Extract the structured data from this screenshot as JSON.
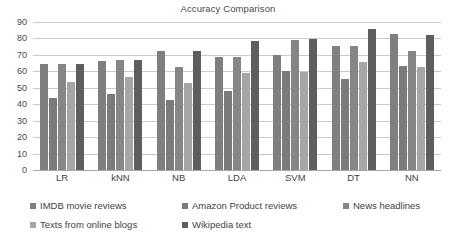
{
  "chart_data": {
    "type": "bar",
    "title": "Accuracy Comparison",
    "xlabel": "",
    "ylabel": "",
    "ylim": [
      0,
      90
    ],
    "yticks": [
      0,
      10,
      20,
      30,
      40,
      50,
      60,
      70,
      80,
      90
    ],
    "grid": true,
    "legend_position": "bottom",
    "categories": [
      "LR",
      "kNN",
      "NB",
      "LDA",
      "SVM",
      "DT",
      "NN"
    ],
    "series": [
      {
        "name": "IMDB movie reviews",
        "color": "#7f7f7f",
        "values": [
          64.5,
          66.3,
          72.5,
          68.5,
          70.0,
          75.2,
          83.0
        ]
      },
      {
        "name": "Amazon Product reviews",
        "color": "#7b7b7b",
        "values": [
          44.0,
          46.2,
          42.3,
          48.3,
          60.3,
          55.5,
          63.5
        ]
      },
      {
        "name": "News headlines",
        "color": "#868686",
        "values": [
          64.5,
          66.8,
          62.8,
          68.5,
          79.0,
          75.6,
          72.2
        ]
      },
      {
        "name": "Texts from online blogs",
        "color": "#a6a6a6",
        "values": [
          53.8,
          56.4,
          52.7,
          58.7,
          59.6,
          65.8,
          62.8
        ]
      },
      {
        "name": "Wikipedia text",
        "color": "#5e5e5e",
        "values": [
          64.5,
          66.9,
          72.6,
          78.5,
          79.5,
          85.5,
          82.4
        ]
      }
    ]
  }
}
